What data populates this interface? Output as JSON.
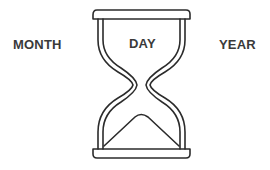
{
  "labels": {
    "month": "MONTH",
    "day": "DAY",
    "year": "YEAR"
  },
  "icon": {
    "name": "hourglass-icon",
    "stroke_color": "#2b2b2b",
    "background_color": "#ffffff"
  },
  "text_color": "#3a3a3a"
}
